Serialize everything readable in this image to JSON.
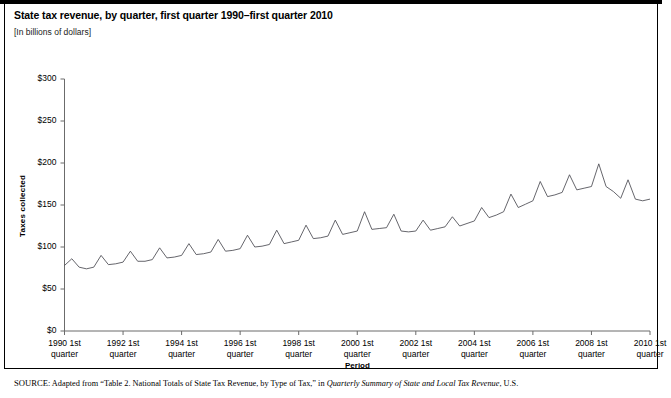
{
  "figure": {
    "title": "State tax revenue, by quarter, first quarter 1990–first quarter 2010",
    "units": "[In billions of dollars]",
    "source_prefix": "SOURCE",
    "source_sep": ": ",
    "source_text_1": "Adapted from “Table 2. National Totals of State Tax Revenue, by Type of Tax,” in ",
    "source_italic": "Quarterly Summary of State and Local Tax Revenue",
    "source_text_2": ", U.S."
  },
  "chart_data": {
    "type": "line",
    "title": "State tax revenue, by quarter, first quarter 1990–first quarter 2010",
    "subtitle": "[In billions of dollars]",
    "xlabel": "Period",
    "ylabel": "Taxes collected",
    "ylim": [
      0,
      300
    ],
    "yticks": [
      0,
      50,
      100,
      150,
      200,
      250,
      300
    ],
    "ytick_labels": [
      "$0",
      "$50",
      "$100",
      "$150",
      "$200",
      "$250",
      "$300"
    ],
    "xtick_labels": [
      "1990 1st quarter",
      "1992 1st quarter",
      "1994 1st quarter",
      "1996 1st quarter",
      "1998 1st quarter",
      "2000 1st quarter",
      "2002 1st quarter",
      "2004 1st quarter",
      "2006 1st quarter",
      "2008 1st quarter",
      "2010 1st quarter"
    ],
    "xtick_values": [
      1990,
      1992,
      1994,
      1996,
      1998,
      2000,
      2002,
      2004,
      2006,
      2008,
      2010
    ],
    "grid": false,
    "legend": "none",
    "series": [
      {
        "name": "State tax revenue",
        "color": "#4a4a52",
        "x": [
          "1990Q1",
          "1990Q2",
          "1990Q3",
          "1990Q4",
          "1991Q1",
          "1991Q2",
          "1991Q3",
          "1991Q4",
          "1992Q1",
          "1992Q2",
          "1992Q3",
          "1992Q4",
          "1993Q1",
          "1993Q2",
          "1993Q3",
          "1993Q4",
          "1994Q1",
          "1994Q2",
          "1994Q3",
          "1994Q4",
          "1995Q1",
          "1995Q2",
          "1995Q3",
          "1995Q4",
          "1996Q1",
          "1996Q2",
          "1996Q3",
          "1996Q4",
          "1997Q1",
          "1997Q2",
          "1997Q3",
          "1997Q4",
          "1998Q1",
          "1998Q2",
          "1998Q3",
          "1998Q4",
          "1999Q1",
          "1999Q2",
          "1999Q3",
          "1999Q4",
          "2000Q1",
          "2000Q2",
          "2000Q3",
          "2000Q4",
          "2001Q1",
          "2001Q2",
          "2001Q3",
          "2001Q4",
          "2002Q1",
          "2002Q2",
          "2002Q3",
          "2002Q4",
          "2003Q1",
          "2003Q2",
          "2003Q3",
          "2003Q4",
          "2004Q1",
          "2004Q2",
          "2004Q3",
          "2004Q4",
          "2005Q1",
          "2005Q2",
          "2005Q3",
          "2005Q4",
          "2006Q1",
          "2006Q2",
          "2006Q3",
          "2006Q4",
          "2007Q1",
          "2007Q2",
          "2007Q3",
          "2007Q4",
          "2008Q1",
          "2008Q2",
          "2008Q3",
          "2008Q4",
          "2009Q1",
          "2009Q2",
          "2009Q3",
          "2009Q4",
          "2010Q1"
        ],
        "values": [
          78,
          86,
          76,
          74,
          76,
          90,
          79,
          80,
          82,
          95,
          83,
          83,
          85,
          99,
          87,
          88,
          90,
          104,
          91,
          92,
          94,
          109,
          95,
          96,
          98,
          114,
          100,
          101,
          103,
          120,
          104,
          106,
          108,
          126,
          110,
          111,
          113,
          132,
          115,
          117,
          119,
          142,
          121,
          122,
          123,
          139,
          119,
          118,
          119,
          132,
          120,
          122,
          124,
          136,
          125,
          128,
          131,
          147,
          135,
          138,
          142,
          163,
          147,
          151,
          155,
          178,
          160,
          162,
          165,
          186,
          168,
          170,
          172,
          199,
          172,
          166,
          158,
          180,
          157,
          155,
          157
        ]
      }
    ],
    "notable_points": [
      {
        "label": "series start (1990 Q1)",
        "value": 78
      },
      {
        "label": "peak (2008 Q2)",
        "value": 199
      },
      {
        "label": "post-peak trough (2009 Q1)",
        "value": 158
      },
      {
        "label": "series end (2010 Q1)",
        "value": 157
      }
    ]
  }
}
